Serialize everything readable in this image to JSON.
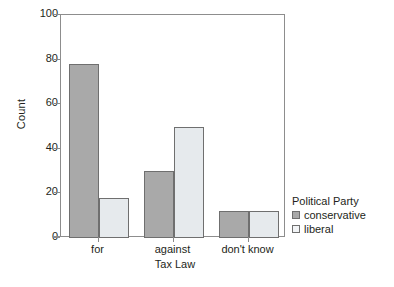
{
  "chart_data": {
    "type": "bar",
    "title": "",
    "subtitle": "",
    "xlabel": "Tax Law",
    "ylabel": "Count",
    "categories": [
      "for",
      "against",
      "don't know"
    ],
    "series": [
      {
        "name": "conservative",
        "values": [
          78,
          30,
          12
        ],
        "color": "#a9a9a9"
      },
      {
        "name": "liberal",
        "values": [
          18,
          50,
          12
        ],
        "color": "#e6eaed"
      }
    ],
    "ylim": [
      0,
      100
    ],
    "yticks": [
      0,
      20,
      40,
      60,
      80,
      100
    ],
    "ytick_labels": [
      "0",
      "20",
      "40",
      "60",
      "80",
      "100"
    ],
    "grid": false,
    "legend": {
      "title": "Political Party",
      "position": "right",
      "entries": [
        {
          "label": "conservative",
          "color": "#a9a9a9"
        },
        {
          "label": "liberal",
          "color": "#f2f4f6"
        }
      ]
    },
    "bar_edge_color": "#6f6f6f",
    "axis_color": "#8d8d8d",
    "background": "#ffffff",
    "grouping": "clustered-adjacent"
  }
}
